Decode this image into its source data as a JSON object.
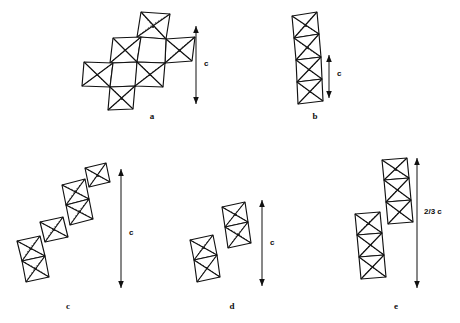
{
  "figure": {
    "type": "crystal-structure-diagram",
    "background_color": "#ffffff",
    "line_color": "#111111",
    "dot_color": "#1a1a1a",
    "panels": [
      {
        "id": "a",
        "label": "a",
        "label_x": 152,
        "label_y": 116,
        "arrow": {
          "label": "c",
          "label_x": 204,
          "label_y": 64,
          "x": 196,
          "y_top": 26,
          "y_bottom": 104,
          "double_headed": true
        },
        "octahedra_count": 7,
        "motif": "two-dimensional corner-and-edge-sharing cluster"
      },
      {
        "id": "b",
        "label": "b",
        "label_x": 315,
        "label_y": 116,
        "arrow": {
          "label": "c",
          "label_x": 337,
          "label_y": 74,
          "x": 329,
          "y_top": 55,
          "y_bottom": 98,
          "double_headed": true
        },
        "octahedra_count": 4,
        "motif": "straight vertical face-sharing chain"
      },
      {
        "id": "c",
        "label": "c",
        "label_x": 68,
        "label_y": 307,
        "arrow": {
          "label": "c",
          "label_x": 129,
          "label_y": 233,
          "x": 121,
          "y_top": 169,
          "y_bottom": 288,
          "double_headed": true
        },
        "octahedra_count": 6,
        "motif": "diagonal staircase of paired octahedra"
      },
      {
        "id": "d",
        "label": "d",
        "label_x": 232,
        "label_y": 307,
        "arrow": {
          "label": "c",
          "label_x": 270,
          "label_y": 248,
          "x": 262,
          "y_top": 200,
          "y_bottom": 286,
          "double_headed": true
        },
        "octahedra_count": 4,
        "motif": "two offset dimer blocks"
      },
      {
        "id": "e",
        "label": "e",
        "label_x": 396,
        "label_y": 307,
        "arrow": {
          "label": "2/3 c",
          "label_x": 424,
          "label_y": 212,
          "x": 417,
          "y_top": 158,
          "y_bottom": 288,
          "double_headed": true
        },
        "octahedra_count": 6,
        "motif": "two offset trimer blocks"
      }
    ]
  }
}
